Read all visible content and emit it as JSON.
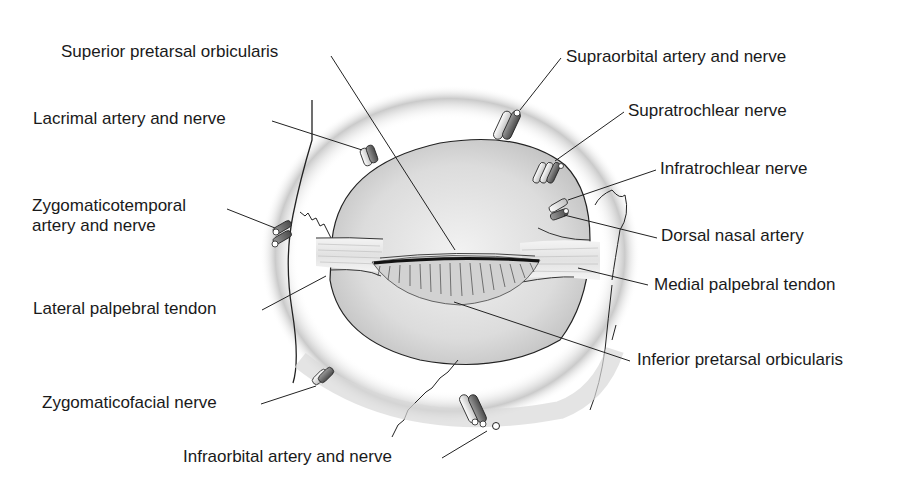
{
  "figure": {
    "colors": {
      "background": "#ffffff",
      "text": "#1a1a1a",
      "leader_line": "#222222",
      "orbit_fill": "#d9d9d9",
      "eyelid_fill": "#c8c8c8",
      "lash_line": "#111111"
    }
  },
  "labels": {
    "superior_pretarsal_orbicularis": "Superior pretarsal orbicularis",
    "lacrimal_artery_and_nerve": "Lacrimal artery and nerve",
    "zygomaticotemporal_line1": "Zygomaticotemporal",
    "zygomaticotemporal_line2": "artery and nerve",
    "lateral_palpebral_tendon": "Lateral palpebral tendon",
    "zygomaticofacial_nerve": "Zygomaticofacial nerve",
    "infraorbital_artery_and_nerve": "Infraorbital artery and nerve",
    "supraorbital_artery_and_nerve": "Supraorbital artery and nerve",
    "supratrochlear_nerve": "Supratrochlear nerve",
    "infratrochlear_nerve": "Infratrochlear nerve",
    "dorsal_nasal_artery": "Dorsal nasal artery",
    "medial_palpebral_tendon": "Medial palpebral tendon",
    "inferior_pretarsal_orbicularis": "Inferior pretarsal orbicularis"
  }
}
